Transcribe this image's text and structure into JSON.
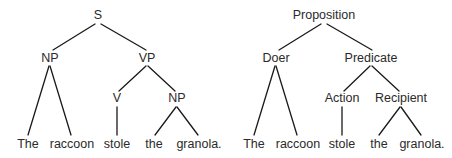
{
  "trees": [
    {
      "name": "syntactic-tree",
      "nodes": {
        "root": {
          "label": "S",
          "x": 98,
          "y": 16
        },
        "np": {
          "label": "NP",
          "x": 50,
          "y": 59
        },
        "vp": {
          "label": "VP",
          "x": 147,
          "y": 59
        },
        "v": {
          "label": "V",
          "x": 117,
          "y": 99
        },
        "np2": {
          "label": "NP",
          "x": 177,
          "y": 99
        }
      },
      "words": [
        {
          "label": "The",
          "x": 28,
          "y": 145
        },
        {
          "label": "raccoon",
          "x": 72,
          "y": 145
        },
        {
          "label": "stole",
          "x": 117,
          "y": 145
        },
        {
          "label": "the",
          "x": 154,
          "y": 145
        },
        {
          "label": "granola.",
          "x": 199,
          "y": 145
        }
      ]
    },
    {
      "name": "semantic-tree",
      "nodes": {
        "root": {
          "label": "Proposition",
          "x": 324,
          "y": 16
        },
        "np": {
          "label": "Doer",
          "x": 276,
          "y": 59
        },
        "vp": {
          "label": "Predicate",
          "x": 371,
          "y": 59
        },
        "v": {
          "label": "Action",
          "x": 342,
          "y": 99
        },
        "np2": {
          "label": "Recipient",
          "x": 401,
          "y": 99
        }
      },
      "words": [
        {
          "label": "The",
          "x": 254,
          "y": 145
        },
        {
          "label": "raccoon",
          "x": 298,
          "y": 145
        },
        {
          "label": "stole",
          "x": 342,
          "y": 145
        },
        {
          "label": "the",
          "x": 379,
          "y": 145
        },
        {
          "label": "granola.",
          "x": 422,
          "y": 145
        }
      ]
    }
  ],
  "colors": {
    "line": "#1a1a1a",
    "text": "#2a2a2a",
    "background": "#ffffff"
  }
}
